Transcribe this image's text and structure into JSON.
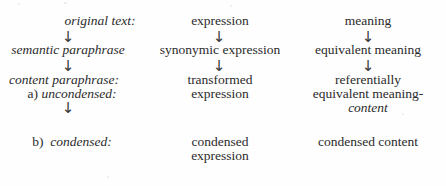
{
  "figure": {
    "type": "three-column-arrow-diagram",
    "background_color": "#fefefe",
    "text_color": "#2b2b2b",
    "arrow_glyph": "↓",
    "columns": [
      {
        "name": "level",
        "label": ""
      },
      {
        "name": "expression",
        "label": ""
      },
      {
        "name": "meaning",
        "label": ""
      }
    ],
    "rows": [
      {
        "id": "original-text",
        "level": {
          "text": "original text:",
          "style": "italic"
        },
        "expression": {
          "lines": [
            "expression"
          ],
          "style": "roman"
        },
        "meaning": {
          "lines": [
            "meaning"
          ],
          "style": "roman"
        },
        "arrow_below": {
          "level": true,
          "expression": true,
          "meaning": true
        }
      },
      {
        "id": "semantic-paraphrase",
        "level": {
          "text": "semantic paraphrase",
          "style": "italic"
        },
        "expression": {
          "lines": [
            "synonymic expression"
          ],
          "style": "roman"
        },
        "meaning": {
          "lines": [
            "equivalent meaning"
          ],
          "style": "roman"
        },
        "arrow_below": {
          "level": true,
          "expression": true,
          "meaning": true
        }
      },
      {
        "id": "content-paraphrase-uncondensed",
        "level": {
          "text": "content paraphrase:",
          "style": "italic",
          "sub_enum": "a)",
          "sub_text": "uncondensed:",
          "sub_style": "italic"
        },
        "expression": {
          "lines": [
            "transformed",
            "expression"
          ],
          "style": "roman"
        },
        "meaning": {
          "lines": [
            "referentially",
            "equivalent meaning-",
            "content"
          ],
          "style": "roman",
          "italic_lines": [
            2
          ]
        },
        "arrow_below": {
          "level": true,
          "expression": false,
          "meaning": false
        }
      },
      {
        "id": "content-paraphrase-condensed",
        "level": {
          "text": "",
          "sub_enum": "b)",
          "sub_text": "condensed:",
          "sub_style": "italic"
        },
        "expression": {
          "lines": [
            "condensed",
            "expression"
          ],
          "style": "roman"
        },
        "meaning": {
          "lines": [
            "condensed content"
          ],
          "style": "roman"
        },
        "arrow_below": {
          "level": false,
          "expression": false,
          "meaning": false
        }
      }
    ]
  }
}
